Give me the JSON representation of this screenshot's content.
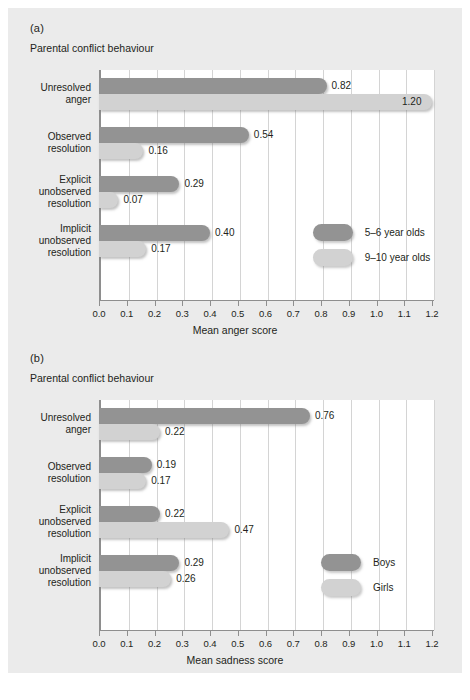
{
  "figure": {
    "background": "#ebebeb",
    "bar_dark_color": "#939393",
    "bar_light_color": "#d2d2d2"
  },
  "panels": [
    {
      "letter": "(a)",
      "subtitle": "Parental conflict behaviour"
    },
    {
      "letter": "(b)",
      "subtitle": "Parental conflict behaviour"
    }
  ],
  "chart_data": [
    {
      "type": "bar",
      "orientation": "horizontal",
      "panel": "(a)",
      "title": "Parental conflict behaviour",
      "xlabel": "Mean anger score",
      "ylabel": "",
      "xlim": [
        0.0,
        1.2
      ],
      "xticks": [
        "0.0",
        "0.1",
        "0.2",
        "0.3",
        "0.4",
        "0.5",
        "0.6",
        "0.7",
        "0.8",
        "0.9",
        "1.0",
        "1.1",
        "1.2"
      ],
      "grid": true,
      "legend_position": "inside-lower-right",
      "categories": [
        "Unresolved anger",
        "Observed resolution",
        "Explicit unobserved resolution",
        "Implicit unobserved resolution"
      ],
      "category_lines": [
        [
          "Unresolved",
          "anger"
        ],
        [
          "Observed",
          "resolution"
        ],
        [
          "Explicit",
          "unobserved",
          "resolution"
        ],
        [
          "Implicit",
          "unobserved",
          "resolution"
        ]
      ],
      "series": [
        {
          "name": "5–6 year olds",
          "color": "#939393",
          "values": [
            0.82,
            0.54,
            0.29,
            0.4
          ],
          "labels": [
            "0.82",
            "0.54",
            "0.29",
            "0.40"
          ]
        },
        {
          "name": "9–10 year olds",
          "color": "#d2d2d2",
          "values": [
            1.2,
            0.16,
            0.07,
            0.17
          ],
          "labels": [
            "1.20",
            "0.16",
            "0.07",
            "0.17"
          ]
        }
      ]
    },
    {
      "type": "bar",
      "orientation": "horizontal",
      "panel": "(b)",
      "title": "Parental conflict behaviour",
      "xlabel": "Mean sadness score",
      "ylabel": "",
      "xlim": [
        0.0,
        1.2
      ],
      "xticks": [
        "0.0",
        "0.1",
        "0.2",
        "0.3",
        "0.4",
        "0.5",
        "0.6",
        "0.7",
        "0.8",
        "0.9",
        "1.0",
        "1.1",
        "1.2"
      ],
      "grid": true,
      "legend_position": "inside-lower-right",
      "categories": [
        "Unresolved anger",
        "Observed resolution",
        "Explicit unobserved resolution",
        "Implicit unobserved resolution"
      ],
      "category_lines": [
        [
          "Unresolved",
          "anger"
        ],
        [
          "Observed",
          "resolution"
        ],
        [
          "Explicit",
          "unobserved",
          "resolution"
        ],
        [
          "Implicit",
          "unobserved",
          "resolution"
        ]
      ],
      "series": [
        {
          "name": "Boys",
          "color": "#939393",
          "values": [
            0.76,
            0.19,
            0.22,
            0.29
          ],
          "labels": [
            "0.76",
            "0.19",
            "0.22",
            "0.29"
          ]
        },
        {
          "name": "Girls",
          "color": "#d2d2d2",
          "values": [
            0.22,
            0.17,
            0.47,
            0.26
          ],
          "labels": [
            "0.22",
            "0.17",
            "0.47",
            "0.26"
          ]
        }
      ]
    }
  ]
}
